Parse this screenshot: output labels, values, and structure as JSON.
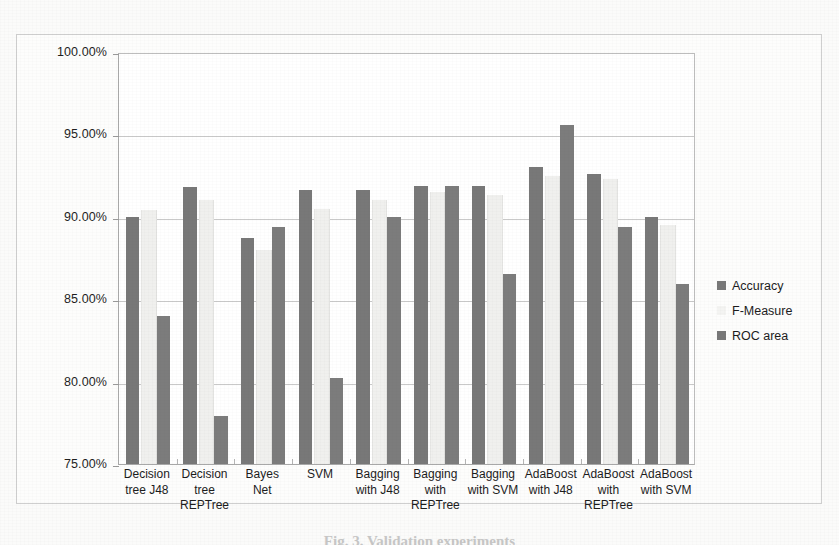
{
  "page": {
    "top_clipped_text": "",
    "bottom_caption": "Fig. 3. Validation experiments"
  },
  "legend": {
    "position": "right",
    "items": [
      {
        "label": "Accuracy",
        "color": "#787878",
        "swatch": "dark"
      },
      {
        "label": "F-Measure",
        "color": "#f4f4f2",
        "swatch": "light"
      },
      {
        "label": "ROC area",
        "color": "#7c7c7c",
        "swatch": "dark"
      }
    ]
  },
  "axis": {
    "y_ticks": [
      "100.00%",
      "95.00%",
      "90.00%",
      "85.00%",
      "80.00%",
      "75.00%"
    ]
  },
  "chart_data": {
    "type": "bar",
    "title": "",
    "subtitle": "",
    "xlabel": "",
    "ylabel": "",
    "ylim": [
      75,
      100
    ],
    "ytick_values": [
      75,
      80,
      85,
      90,
      95,
      100
    ],
    "ytick_labels": [
      "75.00%",
      "80.00%",
      "85.00%",
      "90.00%",
      "95.00%",
      "100.00%"
    ],
    "grid": true,
    "legend_position": "right",
    "categories": [
      "Decision tree J48",
      "Decision tree REPTree",
      "Bayes Net",
      "SVM",
      "Bagging with J48",
      "Bagging with REPTree",
      "Bagging with SVM",
      "AdaBoost with J48",
      "AdaBoost with REPTree",
      "AdaBoost with SVM"
    ],
    "category_lines": [
      [
        "Decision",
        "tree J48"
      ],
      [
        "Decision",
        "tree",
        "REPTree"
      ],
      [
        "Bayes",
        "Net"
      ],
      [
        "SVM"
      ],
      [
        "Bagging",
        "with J48"
      ],
      [
        "Bagging",
        "with",
        "REPTree"
      ],
      [
        "Bagging",
        "with SVM"
      ],
      [
        "AdaBoost",
        "with J48"
      ],
      [
        "AdaBoost",
        "with",
        "REPTree"
      ],
      [
        "AdaBoost",
        "with SVM"
      ]
    ],
    "series": [
      {
        "name": "Accuracy",
        "color": "#787878",
        "values": [
          90.0,
          91.8,
          88.7,
          91.6,
          91.6,
          91.9,
          91.9,
          93.0,
          92.6,
          90.0
        ]
      },
      {
        "name": "F-Measure",
        "color": "#f4f4f2",
        "values": [
          90.4,
          91.0,
          88.0,
          90.5,
          91.0,
          91.5,
          91.3,
          92.5,
          92.3,
          89.5
        ]
      },
      {
        "name": "ROC area",
        "color": "#7c7c7c",
        "values": [
          84.0,
          77.9,
          89.4,
          80.2,
          90.0,
          91.9,
          86.5,
          95.6,
          89.4,
          85.9
        ]
      }
    ]
  }
}
